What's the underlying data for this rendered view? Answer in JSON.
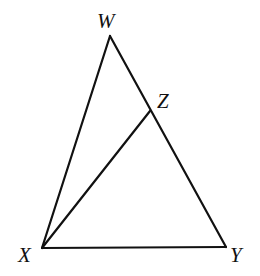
{
  "figure": {
    "type": "triangle-diagram",
    "width": 260,
    "height": 276,
    "stroke_color": "#111111",
    "background": "#ffffff"
  },
  "vertices": {
    "W": {
      "label": "W",
      "x": 110,
      "y": 36,
      "label_x": 97,
      "label_y": 28
    },
    "Z": {
      "label": "Z",
      "x": 150,
      "y": 111,
      "label_x": 157,
      "label_y": 108
    },
    "X": {
      "label": "X",
      "x": 42,
      "y": 248,
      "label_x": 18,
      "label_y": 262
    },
    "Y": {
      "label": "Y",
      "x": 226,
      "y": 247,
      "label_x": 230,
      "label_y": 262
    }
  },
  "segments": [
    {
      "name": "segment-WX",
      "from": "W",
      "to": "X"
    },
    {
      "name": "segment-WY",
      "from": "W",
      "to": "Y",
      "note": "passes through Z"
    },
    {
      "name": "segment-XY",
      "from": "X",
      "to": "Y"
    },
    {
      "name": "segment-XZ",
      "from": "X",
      "to": "Z"
    }
  ],
  "labels": {
    "W": "W",
    "Z": "Z",
    "X": "X",
    "Y": "Y"
  }
}
